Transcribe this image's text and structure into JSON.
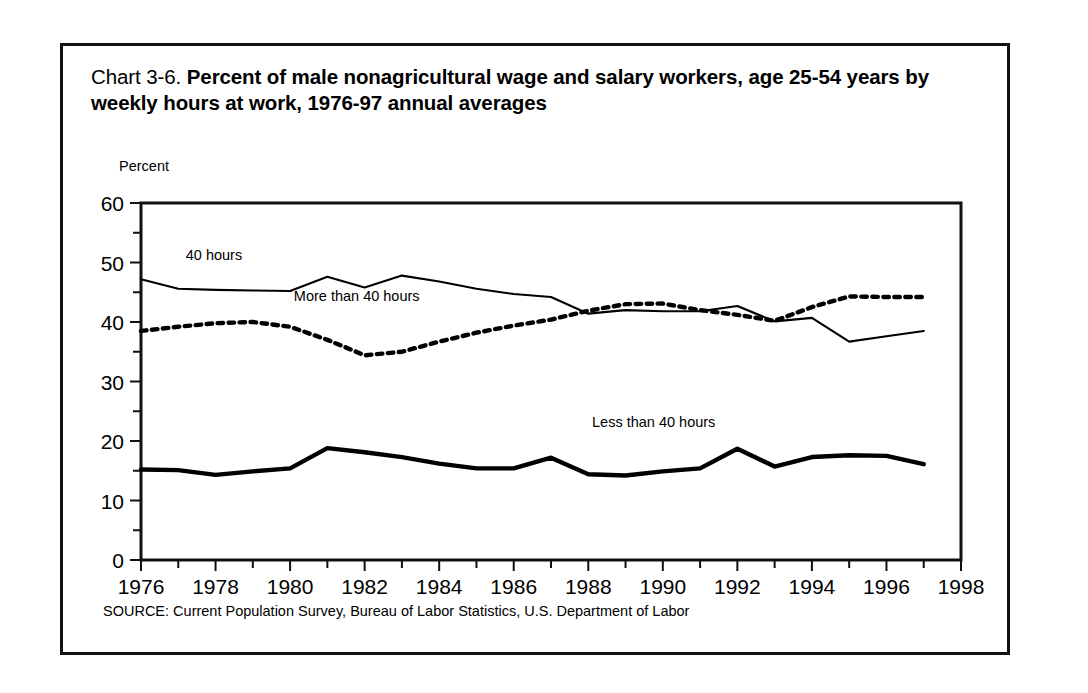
{
  "figure": {
    "chart_number": "Chart 3-6.",
    "title": "Percent of male nonagricultural wage and salary workers, age 25-54 years by weekly hours at work, 1976-97 annual averages",
    "y_axis_caption": "Percent",
    "source": "SOURCE: Current Population Survey, Bureau of Labor Statistics, U.S. Department of Labor"
  },
  "chart_data": {
    "type": "line",
    "title": "Chart 3-6. Percent of male nonagricultural wage and salary workers, age 25-54 years by weekly hours at work, 1976-97 annual averages",
    "xlabel": "",
    "ylabel": "Percent",
    "xlim": [
      1976,
      1998
    ],
    "ylim": [
      0,
      60
    ],
    "yticks": [
      0,
      10,
      20,
      30,
      40,
      50,
      60
    ],
    "ytick_labels": [
      "0",
      "10",
      "20",
      "30",
      "40",
      "50",
      "60"
    ],
    "y_minor_tick_step": 5,
    "xticks": [
      1976,
      1978,
      1980,
      1982,
      1984,
      1986,
      1988,
      1990,
      1992,
      1994,
      1996,
      1998
    ],
    "xtick_labels": [
      "1976",
      "1978",
      "1980",
      "1982",
      "1984",
      "1986",
      "1988",
      "1990",
      "1992",
      "1994",
      "1996",
      "1998"
    ],
    "x_minor_tick_step": 1,
    "grid": false,
    "legend": "inline-annotations",
    "x": [
      1976,
      1977,
      1978,
      1979,
      1980,
      1981,
      1982,
      1983,
      1984,
      1985,
      1986,
      1987,
      1988,
      1989,
      1990,
      1991,
      1992,
      1993,
      1994,
      1995,
      1996,
      1997
    ],
    "series": [
      {
        "name": "40 hours",
        "style": "thin-solid",
        "label_x": 1977.2,
        "label_y": 50.5,
        "values": [
          47.2,
          45.6,
          45.4,
          45.3,
          45.2,
          47.6,
          45.8,
          47.8,
          46.8,
          45.6,
          44.7,
          44.2,
          41.4,
          42.0,
          41.8,
          41.8,
          42.7,
          40.1,
          40.7,
          36.7,
          37.6,
          38.5
        ]
      },
      {
        "name": "More than 40 hours",
        "style": "dotted",
        "label_x": 1980.1,
        "label_y": 43.6,
        "values": [
          38.5,
          39.2,
          39.8,
          40.0,
          39.2,
          37.0,
          34.4,
          35.0,
          36.7,
          38.2,
          39.4,
          40.4,
          41.9,
          43.0,
          43.1,
          42.0,
          41.2,
          40.2,
          42.5,
          44.3,
          44.2,
          44.2
        ]
      },
      {
        "name": "Less than 40 hours",
        "style": "thick-solid",
        "label_x": 1988.1,
        "label_y": 22.4,
        "values": [
          15.2,
          15.1,
          14.3,
          14.9,
          15.4,
          18.8,
          18.1,
          17.3,
          16.2,
          15.4,
          15.4,
          17.2,
          14.4,
          14.2,
          14.9,
          15.4,
          18.7,
          15.7,
          17.3,
          17.6,
          17.5,
          16.1
        ]
      }
    ]
  }
}
